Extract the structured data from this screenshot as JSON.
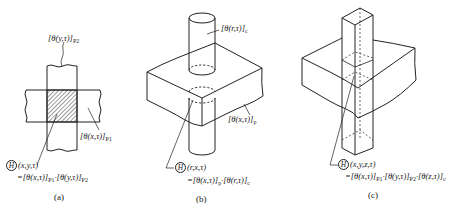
{
  "figure": {
    "panels": [
      {
        "id": "a",
        "caption": "(a)",
        "labels": {
          "top_strip": {
            "text": "[θ(y,τ)]",
            "sub": "P2"
          },
          "side_strip": {
            "text": "[θ(x,τ)]",
            "sub": "P1"
          },
          "intersection_symbol": "H",
          "intersection_args": "(x,y,τ)",
          "formula_prefix": "=[θ(x,τ)]",
          "formula_sub1": "P1",
          "formula_mid": "·[θ(y,τ)]",
          "formula_sub2": "P2"
        },
        "description": "Two perpendicular plates (strips) crossing; hatched intersection region"
      },
      {
        "id": "b",
        "caption": "(b)",
        "labels": {
          "cylinder": {
            "text": "[θ(r,τ)]",
            "sub": "c"
          },
          "plate": {
            "text": "[θ(x,τ)]",
            "sub": "p"
          },
          "intersection_symbol": "H",
          "intersection_args": "(r,x,τ)",
          "formula_prefix": "=[θ(x,τ)]",
          "formula_sub1": "p",
          "formula_mid": "·[θ(r,τ)]",
          "formula_sub2": "c"
        },
        "description": "Cylinder passing vertically through a rectangular slab"
      },
      {
        "id": "c",
        "caption": "(c)",
        "labels": {
          "intersection_symbol": "H",
          "intersection_args": "(x,y,z,τ)",
          "formula_prefix": "=[θ(x,τ)]",
          "formula_sub1": "P1",
          "formula_mid1": "·[θ(y,τ)]",
          "formula_sub2": "P2",
          "formula_mid2": "·[θ(z,τ)]",
          "formula_sub3": "c"
        },
        "description": "Square column passing vertically through a rectangular slab"
      }
    ],
    "colors": {
      "line": "#222222",
      "background": "#ffffff"
    }
  }
}
